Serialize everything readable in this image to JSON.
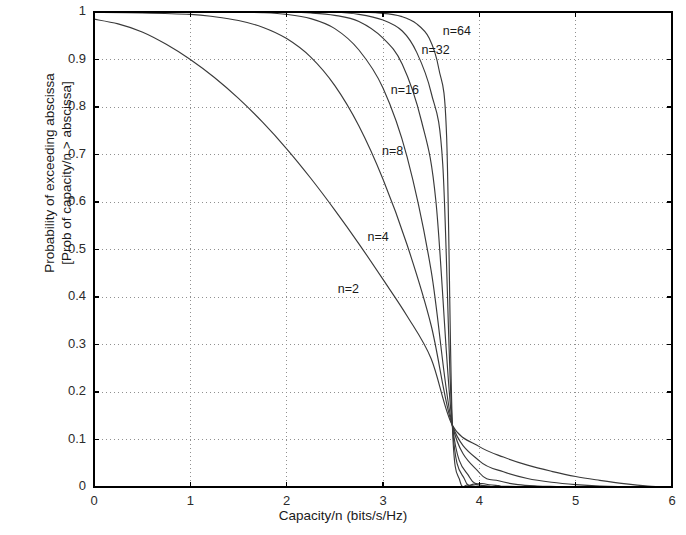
{
  "chart_data": {
    "type": "line",
    "title": "",
    "xlabel": "Capacity/n (bits/s/Hz)",
    "ylabel_line1": "Probability of exceeding abscissa",
    "ylabel_line2": "[Prob of capacity/n > abscissa]",
    "xlim": [
      0,
      6
    ],
    "ylim": [
      0,
      1
    ],
    "xticks": [
      "0",
      "1",
      "2",
      "3",
      "4",
      "5",
      "6"
    ],
    "yticks": [
      "0",
      "0.1",
      "0.2",
      "0.3",
      "0.4",
      "0.5",
      "0.6",
      "0.7",
      "0.8",
      "0.9",
      "1"
    ],
    "grid": "dotted",
    "legend_position": "inline-curve-labels",
    "crossing_point": {
      "x": 3.72,
      "y": 0.13
    },
    "line_color": "#3a3a3a",
    "grid_color": "#909090",
    "axis_color": "#000000",
    "series": [
      {
        "name": "n=2",
        "label": "n=2",
        "label_x": 2.53,
        "label_y": 0.415,
        "x": [
          0,
          0.25,
          0.5,
          0.75,
          1.0,
          1.25,
          1.5,
          1.75,
          2.0,
          2.25,
          2.5,
          2.75,
          3.0,
          3.25,
          3.5,
          3.72,
          4.0,
          4.25,
          4.5,
          4.75,
          5.0,
          5.25,
          5.5,
          5.75,
          6.0
        ],
        "y": [
          0.985,
          0.975,
          0.958,
          0.932,
          0.9,
          0.862,
          0.818,
          0.768,
          0.712,
          0.65,
          0.583,
          0.512,
          0.437,
          0.36,
          0.27,
          0.13,
          0.085,
          0.063,
          0.046,
          0.033,
          0.022,
          0.014,
          0.007,
          0.002,
          0.0
        ]
      },
      {
        "name": "n=4",
        "label": "n=4",
        "label_x": 2.84,
        "label_y": 0.525,
        "x": [
          0,
          0.5,
          1.0,
          1.25,
          1.5,
          1.75,
          2.0,
          2.25,
          2.5,
          2.75,
          3.0,
          3.25,
          3.5,
          3.72,
          4.0,
          4.25,
          4.5,
          4.75,
          5.0,
          5.25,
          5.5,
          6.0
        ],
        "y": [
          0.999,
          0.998,
          0.995,
          0.99,
          0.982,
          0.968,
          0.944,
          0.905,
          0.845,
          0.76,
          0.648,
          0.51,
          0.34,
          0.13,
          0.055,
          0.032,
          0.018,
          0.01,
          0.005,
          0.002,
          0.001,
          0.0
        ]
      },
      {
        "name": "n=8",
        "label": "n=8",
        "label_x": 2.99,
        "label_y": 0.705,
        "x": [
          0,
          1.0,
          1.5,
          1.75,
          2.0,
          2.25,
          2.5,
          2.75,
          3.0,
          3.25,
          3.5,
          3.72,
          4.0,
          4.2,
          4.4,
          4.6,
          4.8,
          5.0,
          6.0
        ],
        "y": [
          1.0,
          0.9999,
          0.9995,
          0.9985,
          0.995,
          0.986,
          0.965,
          0.92,
          0.84,
          0.695,
          0.455,
          0.13,
          0.03,
          0.013,
          0.005,
          0.002,
          0.001,
          0.0,
          0.0
        ]
      },
      {
        "name": "n=16",
        "label": "n=16",
        "label_x": 3.08,
        "label_y": 0.833,
        "x": [
          0,
          1.5,
          2.0,
          2.25,
          2.5,
          2.75,
          3.0,
          3.2,
          3.4,
          3.55,
          3.72,
          3.9,
          4.05,
          4.2,
          4.4,
          6.0
        ],
        "y": [
          1.0,
          1.0,
          0.9995,
          0.998,
          0.993,
          0.98,
          0.945,
          0.89,
          0.77,
          0.6,
          0.13,
          0.02,
          0.007,
          0.003,
          0.001,
          0.0
        ]
      },
      {
        "name": "n=32",
        "label": "n=32",
        "label_x": 3.4,
        "label_y": 0.917,
        "x": [
          0,
          2.0,
          2.5,
          2.75,
          3.0,
          3.2,
          3.35,
          3.5,
          3.62,
          3.72,
          3.85,
          3.95,
          4.1,
          4.3,
          6.0
        ],
        "y": [
          1.0,
          1.0,
          0.9995,
          0.995,
          0.983,
          0.96,
          0.915,
          0.83,
          0.68,
          0.13,
          0.015,
          0.006,
          0.002,
          0.0,
          0.0
        ]
      },
      {
        "name": "n=64",
        "label": "n=64",
        "label_x": 3.62,
        "label_y": 0.958,
        "x": [
          0,
          2.5,
          3.0,
          3.2,
          3.35,
          3.48,
          3.58,
          3.66,
          3.72,
          3.8,
          3.88,
          4.0,
          4.2,
          6.0
        ],
        "y": [
          1.0,
          1.0,
          0.997,
          0.99,
          0.975,
          0.945,
          0.88,
          0.74,
          0.13,
          0.012,
          0.004,
          0.001,
          0.0,
          0.0
        ]
      }
    ]
  },
  "plot_geometry": {
    "left": 94,
    "right": 672,
    "top": 12,
    "bottom": 487
  }
}
